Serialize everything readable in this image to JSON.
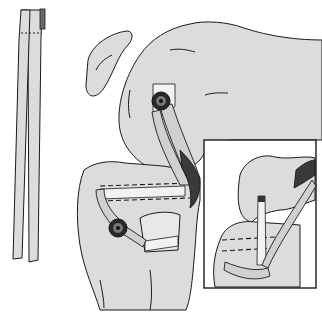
{
  "figure": {
    "background": "#ffffff",
    "stroke_color": "#1a1a1a",
    "fill_color": "#dcdcdc",
    "panels": [
      {
        "name": "graft-strip",
        "region": [
          15,
          10,
          45,
          262
        ]
      },
      {
        "name": "main-knee-view",
        "region": [
          70,
          30,
          322,
          310
        ]
      },
      {
        "name": "inset-detail",
        "region": [
          204,
          140,
          316,
          288
        ]
      }
    ],
    "fixation_points": [
      {
        "name": "femoral-screw",
        "x": 161,
        "y": 101
      },
      {
        "name": "tibial-screw",
        "x": 118,
        "y": 228
      }
    ],
    "labels": []
  }
}
